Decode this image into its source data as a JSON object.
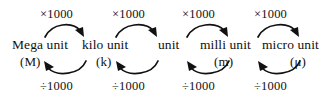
{
  "diagram": {
    "type": "unit-prefix-conversion-chain",
    "width": 332,
    "height": 98,
    "background_color": "#ffffff",
    "ink_color": "#111111",
    "units": [
      {
        "name": "Mega unit",
        "symbol": "(M)",
        "name_x": 12,
        "name_y": 38,
        "sym_x": 20,
        "sym_y": 55
      },
      {
        "name": "kilo unit",
        "symbol": "(k)",
        "name_x": 82,
        "name_y": 38,
        "sym_x": 96,
        "sym_y": 55
      },
      {
        "name": "unit",
        "symbol": "",
        "name_x": 158,
        "name_y": 38,
        "sym_x": 0,
        "sym_y": 0
      },
      {
        "name": "milli unit",
        "symbol": "(m)",
        "name_x": 200,
        "name_y": 38,
        "sym_x": 214,
        "sym_y": 55
      },
      {
        "name": "micro unit",
        "symbol": "(μ)",
        "name_x": 262,
        "name_y": 38,
        "sym_x": 290,
        "sym_y": 55
      }
    ],
    "multiply": {
      "label": "×1000",
      "direction": "left-to-right",
      "arrows": [
        {
          "label_x": 40,
          "label_y": 8,
          "from_x": 45,
          "to_x": 83,
          "peak_y": 24,
          "base_y": 38
        },
        {
          "label_x": 112,
          "label_y": 8,
          "from_x": 115,
          "to_x": 155,
          "peak_y": 24,
          "base_y": 38
        },
        {
          "label_x": 182,
          "label_y": 8,
          "from_x": 186,
          "to_x": 226,
          "peak_y": 24,
          "base_y": 38
        },
        {
          "label_x": 254,
          "label_y": 8,
          "from_x": 257,
          "to_x": 297,
          "peak_y": 24,
          "base_y": 38
        }
      ]
    },
    "divide": {
      "label": "÷1000",
      "direction": "right-to-left",
      "arrows": [
        {
          "label_x": 40,
          "label_y": 80,
          "from_x": 86,
          "to_x": 45,
          "peak_y": 76,
          "base_y": 60
        },
        {
          "label_x": 112,
          "label_y": 80,
          "from_x": 158,
          "to_x": 117,
          "peak_y": 76,
          "base_y": 60
        },
        {
          "label_x": 182,
          "label_y": 80,
          "from_x": 228,
          "to_x": 188,
          "peak_y": 76,
          "base_y": 60
        },
        {
          "label_x": 254,
          "label_y": 80,
          "from_x": 300,
          "to_x": 259,
          "peak_y": 76,
          "base_y": 60
        }
      ]
    }
  }
}
